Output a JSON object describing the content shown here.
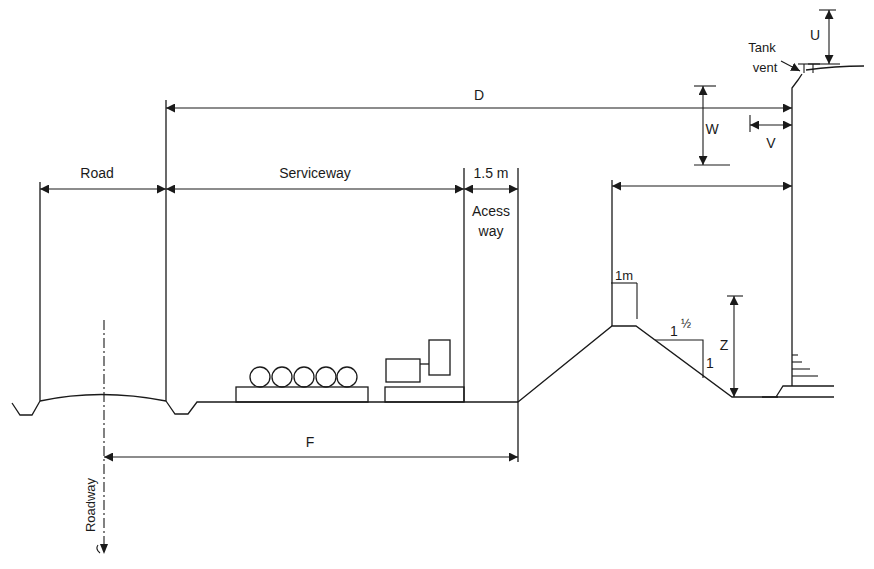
{
  "diagram": {
    "type": "cross-section",
    "colors": {
      "line": "#1a1a1a",
      "background": "#ffffff"
    },
    "labels": {
      "road": "Road",
      "serviceway": "Serviceway",
      "access_width": "1.5 m",
      "access_line1": "Acess",
      "access_line2": "way",
      "dim_d": "D",
      "dim_f": "F",
      "dim_u": "U",
      "dim_v": "V",
      "dim_w": "W",
      "dim_z": "Z",
      "tank_vent_line1": "Tank",
      "tank_vent_line2": "vent",
      "bund_top_width": "1m",
      "slope_horizontal": "1",
      "slope_fraction": "½",
      "slope_vertical": "1",
      "roadway": "Roadway"
    }
  }
}
